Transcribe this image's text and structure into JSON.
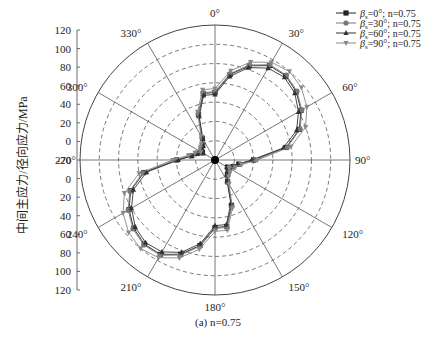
{
  "chart_data": {
    "type": "polar-line",
    "title": "",
    "caption": "(a) n=0.75",
    "ylabel": "中间主应力/径向应力/MPa",
    "radial_range": [
      -20,
      120
    ],
    "radial_ticks": [
      120,
      100,
      80,
      60,
      40,
      20,
      0,
      -20,
      0,
      20,
      40,
      60,
      80,
      100,
      120
    ],
    "angle_ticks": [
      "0°",
      "30°",
      "60°",
      "90°",
      "120°",
      "150°",
      "180°",
      "210°",
      "240°",
      "270°",
      "300°",
      "330°"
    ],
    "grid": true,
    "legend_position": "top-right",
    "angles": [
      0,
      10,
      20,
      30,
      40,
      50,
      60,
      70,
      80,
      90,
      100,
      110,
      120,
      130,
      140,
      150,
      160,
      170,
      180,
      190,
      200,
      210,
      220,
      230,
      240,
      250,
      260,
      270,
      280,
      290,
      300,
      310,
      320,
      330,
      340,
      350
    ],
    "series": [
      {
        "name": "βs=0°; n=0.75",
        "marker": "square",
        "color": "#222222",
        "values": [
          50,
          70,
          84,
          93,
          94,
          90,
          83,
          73,
          55,
          20,
          5,
          0,
          -5,
          -2,
          0,
          6,
          30,
          50,
          50,
          70,
          84,
          93,
          94,
          90,
          83,
          73,
          55,
          20,
          5,
          0,
          -5,
          -2,
          0,
          6,
          30,
          50
        ]
      },
      {
        "name": "βs=30°; n=0.75",
        "marker": "circle",
        "color": "#777777",
        "values": [
          51,
          71,
          85,
          94,
          95,
          91,
          84,
          74,
          56,
          21,
          6,
          1,
          -4,
          -1,
          1,
          7,
          31,
          51,
          51,
          71,
          85,
          94,
          95,
          91,
          84,
          74,
          56,
          21,
          6,
          1,
          -4,
          -1,
          1,
          7,
          31,
          51
        ]
      },
      {
        "name": "βs=60°; n=0.75",
        "marker": "triangle-up",
        "color": "#333333",
        "values": [
          48,
          68,
          82,
          90,
          92,
          88,
          80,
          70,
          52,
          18,
          4,
          -1,
          -6,
          -3,
          -1,
          5,
          28,
          48,
          48,
          68,
          82,
          90,
          92,
          88,
          80,
          70,
          52,
          18,
          4,
          -1,
          -6,
          -3,
          -1,
          5,
          28,
          48
        ]
      },
      {
        "name": "βs=90°; n=0.75",
        "marker": "triangle-down",
        "color": "#888888",
        "values": [
          54,
          74,
          88,
          97,
          100,
          97,
          90,
          80,
          60,
          24,
          8,
          2,
          -3,
          0,
          2,
          9,
          33,
          54,
          54,
          74,
          88,
          97,
          100,
          97,
          90,
          80,
          60,
          24,
          8,
          2,
          -3,
          0,
          2,
          9,
          33,
          54
        ]
      }
    ]
  },
  "legend": {
    "items": [
      {
        "prefix": "β",
        "sub": "s",
        "text": "=0°; n=0.75"
      },
      {
        "prefix": "β",
        "sub": "s",
        "text": "=30°; n=0.75"
      },
      {
        "prefix": "β",
        "sub": "s",
        "text": "=60°; n=0.75"
      },
      {
        "prefix": "β",
        "sub": "s",
        "text": "=90°; n=0.75"
      }
    ]
  }
}
